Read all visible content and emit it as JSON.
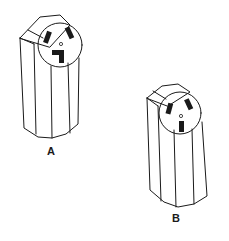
{
  "figure": {
    "type": "line-drawing",
    "stroke_color": "#1a1a1a",
    "background": "#ffffff"
  },
  "receptacles": [
    {
      "id": "A",
      "label": "A",
      "description": "surface-mount receptacle, two angled slots and L-shaped ground slot"
    },
    {
      "id": "B",
      "label": "B",
      "description": "surface-mount receptacle, two angled slots and straight vertical ground slot"
    }
  ]
}
